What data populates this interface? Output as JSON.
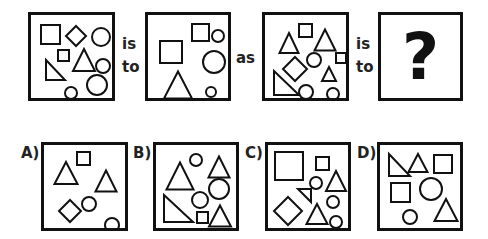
{
  "puzzle": {
    "type": "figure-analogy",
    "connector_1": [
      "is",
      "to"
    ],
    "connector_2": "as",
    "connector_3": [
      "is",
      "to"
    ],
    "unknown_symbol": "?",
    "stroke_color": "#111111",
    "background": "#ffffff",
    "figure_1": {
      "shapes": [
        {
          "kind": "square",
          "x": 10,
          "y": 10,
          "size": 19
        },
        {
          "kind": "diamond",
          "cx": 45,
          "cy": 21,
          "r": 10
        },
        {
          "kind": "circle",
          "cx": 70,
          "cy": 22,
          "r": 9
        },
        {
          "kind": "square",
          "x": 27,
          "y": 35,
          "size": 11
        },
        {
          "kind": "triangle",
          "cx": 53,
          "cy": 45,
          "w": 22,
          "h": 22
        },
        {
          "kind": "right-triangle",
          "x": 15,
          "y": 45,
          "w": 19,
          "h": 20
        },
        {
          "kind": "circle",
          "cx": 72,
          "cy": 51,
          "r": 7
        },
        {
          "kind": "circle",
          "cx": 66,
          "cy": 70,
          "r": 10
        },
        {
          "kind": "circle",
          "cx": 40,
          "cy": 78,
          "r": 6
        }
      ]
    },
    "figure_2": {
      "shapes": [
        {
          "kind": "square",
          "x": 44,
          "y": 9,
          "size": 17
        },
        {
          "kind": "circle",
          "cx": 70,
          "cy": 21,
          "r": 6
        },
        {
          "kind": "square",
          "x": 12,
          "y": 26,
          "size": 22
        },
        {
          "kind": "circle",
          "cx": 66,
          "cy": 47,
          "r": 11
        },
        {
          "kind": "triangle",
          "cx": 30,
          "cy": 70,
          "w": 28,
          "h": 27
        },
        {
          "kind": "circle",
          "cx": 63,
          "cy": 77,
          "r": 5
        }
      ]
    },
    "figure_3": {
      "shapes": [
        {
          "kind": "triangle",
          "cx": 24,
          "cy": 28,
          "w": 19,
          "h": 20
        },
        {
          "kind": "square",
          "x": 34,
          "y": 9,
          "size": 13
        },
        {
          "kind": "triangle",
          "cx": 60,
          "cy": 25,
          "w": 21,
          "h": 21
        },
        {
          "kind": "diamond",
          "cx": 30,
          "cy": 54,
          "r": 12
        },
        {
          "kind": "circle",
          "cx": 49,
          "cy": 45,
          "r": 7
        },
        {
          "kind": "square",
          "x": 71,
          "y": 38,
          "size": 10
        },
        {
          "kind": "triangle",
          "cx": 64,
          "cy": 59,
          "w": 14,
          "h": 14
        },
        {
          "kind": "right-triangle",
          "x": 9,
          "y": 56,
          "w": 25,
          "h": 24
        },
        {
          "kind": "circle",
          "cx": 41,
          "cy": 77,
          "r": 7
        },
        {
          "kind": "circle",
          "cx": 68,
          "cy": 79,
          "r": 6
        }
      ]
    },
    "options": [
      {
        "label": "A)",
        "shapes": [
          {
            "kind": "triangle",
            "cx": 22,
            "cy": 28,
            "w": 23,
            "h": 22
          },
          {
            "kind": "square",
            "x": 33,
            "y": 7,
            "size": 13
          },
          {
            "kind": "triangle",
            "cx": 62,
            "cy": 36,
            "w": 21,
            "h": 21
          },
          {
            "kind": "diamond",
            "cx": 26,
            "cy": 66,
            "r": 11
          },
          {
            "kind": "circle",
            "cx": 45,
            "cy": 59,
            "r": 7
          },
          {
            "kind": "circle",
            "cx": 68,
            "cy": 80,
            "r": 7
          }
        ]
      },
      {
        "label": "B)",
        "shapes": [
          {
            "kind": "triangle",
            "cx": 24,
            "cy": 31,
            "w": 27,
            "h": 27
          },
          {
            "kind": "circle",
            "cx": 40,
            "cy": 15,
            "r": 6
          },
          {
            "kind": "triangle",
            "cx": 63,
            "cy": 22,
            "w": 21,
            "h": 21
          },
          {
            "kind": "circle",
            "cx": 63,
            "cy": 44,
            "r": 10
          },
          {
            "kind": "circle",
            "cx": 44,
            "cy": 55,
            "r": 8
          },
          {
            "kind": "right-triangle",
            "x": 8,
            "y": 50,
            "w": 29,
            "h": 27
          },
          {
            "kind": "square",
            "x": 41,
            "y": 67,
            "size": 11
          },
          {
            "kind": "triangle",
            "cx": 64,
            "cy": 71,
            "w": 22,
            "h": 21
          }
        ]
      },
      {
        "label": "C)",
        "shapes": [
          {
            "kind": "square",
            "x": 7,
            "y": 7,
            "size": 28
          },
          {
            "kind": "square",
            "x": 48,
            "y": 12,
            "size": 13
          },
          {
            "kind": "triangle",
            "cx": 68,
            "cy": 36,
            "w": 20,
            "h": 20
          },
          {
            "kind": "circle",
            "cx": 48,
            "cy": 38,
            "r": 6
          },
          {
            "kind": "right-triangle-flipped",
            "x": 30,
            "y": 44,
            "w": 13,
            "h": 13
          },
          {
            "kind": "diamond",
            "cx": 20,
            "cy": 66,
            "r": 14
          },
          {
            "kind": "circle",
            "cx": 65,
            "cy": 57,
            "r": 6
          },
          {
            "kind": "triangle",
            "cx": 49,
            "cy": 69,
            "w": 21,
            "h": 20
          },
          {
            "kind": "circle",
            "cx": 68,
            "cy": 77,
            "r": 6
          }
        ]
      },
      {
        "label": "D)",
        "shapes": [
          {
            "kind": "right-triangle",
            "x": 9,
            "y": 9,
            "w": 21,
            "h": 22
          },
          {
            "kind": "triangle",
            "cx": 38,
            "cy": 18,
            "w": 19,
            "h": 18
          },
          {
            "kind": "square",
            "x": 54,
            "y": 10,
            "size": 18
          },
          {
            "kind": "square",
            "x": 11,
            "y": 38,
            "size": 19
          },
          {
            "kind": "circle",
            "cx": 51,
            "cy": 44,
            "r": 11
          },
          {
            "kind": "circle",
            "cx": 30,
            "cy": 72,
            "r": 7
          },
          {
            "kind": "triangle",
            "cx": 66,
            "cy": 65,
            "w": 23,
            "h": 22
          }
        ]
      }
    ]
  }
}
